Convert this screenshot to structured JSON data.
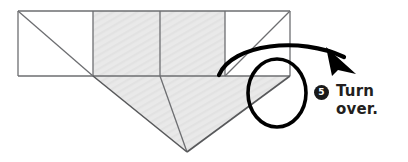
{
  "diagram": {
    "colors": {
      "paper_shaded": "#e8e8e8",
      "paper_white": "#ffffff",
      "stroke": "#58595b",
      "stroke_dark": "#6d6e71",
      "arrow": "#000000",
      "text": "#231f20",
      "bullet_bg": "#1a1a1a",
      "bullet_text": "#ffffff",
      "background": "#ffffff"
    },
    "band": {
      "top": 10,
      "bottom": 76,
      "left": 18,
      "right": 290,
      "dividers_x": [
        93,
        160,
        225
      ]
    },
    "cells": [
      {
        "name": "left-square",
        "fill": "white",
        "diagonal": "top-left-to-bottom-right"
      },
      {
        "name": "mid-left-square",
        "fill": "shaded",
        "diagonal": "none"
      },
      {
        "name": "mid-right-square",
        "fill": "shaded",
        "diagonal": "none"
      },
      {
        "name": "right-square",
        "fill": "white",
        "diagonal": "bottom-left-to-top-right"
      }
    ],
    "triangle": {
      "name": "shaded-point",
      "apex_x": 187,
      "apex_y": 152,
      "left_x": 93,
      "right_x": 290,
      "base_y": 76,
      "center_crease_x": 160
    },
    "arrow": {
      "name": "turn-over-arrow",
      "style": "curved-with-loop",
      "direction": "left-to-right-over",
      "stroke_width": 4
    },
    "loop": {
      "name": "rotation-loop",
      "cx": 277,
      "cy": 93,
      "rx": 29,
      "ry": 34
    }
  },
  "step": {
    "number": "5",
    "text": "Turn over."
  }
}
